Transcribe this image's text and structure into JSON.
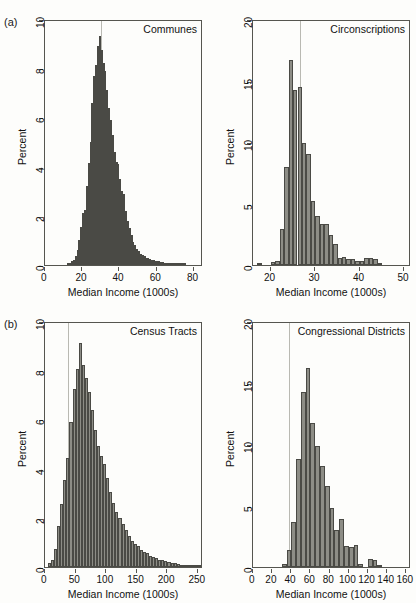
{
  "figure": {
    "panel_tags": [
      "(a)",
      "(b)"
    ],
    "xlabel": "Median Income (1000s)",
    "ylabel": "Percent",
    "bar_color": "#8d8d86",
    "bar_border_color": "#4a4a45",
    "refline_color": "#b9b9b2",
    "axis_color": "#55554f",
    "background": "#fdfdfb"
  },
  "chart_data": [
    {
      "type": "bar",
      "panel": "(a)",
      "title": "Communes",
      "xlabel": "Median Income (1000s)",
      "ylabel": "Percent",
      "xlim": [
        0,
        85
      ],
      "ylim": [
        0,
        10
      ],
      "xticks": [
        0,
        20,
        40,
        60,
        80
      ],
      "yticks": [
        0,
        2,
        4,
        6,
        8,
        10
      ],
      "grid": false,
      "reference_line_x": 30,
      "bin_width": 1,
      "bin_starts": [
        12,
        13,
        14,
        15,
        16,
        17,
        18,
        19,
        20,
        21,
        22,
        23,
        24,
        25,
        26,
        27,
        28,
        29,
        30,
        31,
        32,
        33,
        34,
        35,
        36,
        37,
        38,
        39,
        40,
        41,
        42,
        43,
        44,
        45,
        46,
        47,
        48,
        49,
        50,
        51,
        52,
        53,
        54,
        55,
        56,
        57,
        58,
        59,
        60,
        61,
        62,
        63,
        64,
        65,
        66,
        67,
        68,
        69,
        70,
        71,
        72,
        73,
        74,
        75
      ],
      "values": [
        0.05,
        0.1,
        0.15,
        0.2,
        0.35,
        0.6,
        1.0,
        1.55,
        2.1,
        2.25,
        3.2,
        4.15,
        5.0,
        6.6,
        7.7,
        8.15,
        8.9,
        9.3,
        8.75,
        8.2,
        7.9,
        7.1,
        6.4,
        5.9,
        5.3,
        4.6,
        4.2,
        4.1,
        3.5,
        3.0,
        2.9,
        2.2,
        1.8,
        1.5,
        1.2,
        0.95,
        0.8,
        0.65,
        0.55,
        0.45,
        0.4,
        0.35,
        0.3,
        0.28,
        0.25,
        0.22,
        0.2,
        0.18,
        0.16,
        0.15,
        0.13,
        0.12,
        0.1,
        0.09,
        0.08,
        0.07,
        0.06,
        0.05,
        0.05,
        0.04,
        0.04,
        0.03,
        0.03,
        0.02
      ]
    },
    {
      "type": "bar",
      "panel": "(a)",
      "title": "Circonscriptions",
      "xlabel": "Median Income (1000s)",
      "ylabel": "Percent",
      "xlim": [
        16,
        51.5
      ],
      "ylim": [
        0,
        20
      ],
      "xticks": [
        20,
        30,
        40,
        50
      ],
      "yticks": [
        0,
        5,
        10,
        15,
        20
      ],
      "grid": false,
      "reference_line_x": 26.5,
      "bin_width": 1,
      "bin_starts": [
        17,
        18,
        19,
        20,
        21,
        22,
        23,
        24,
        25,
        26,
        27,
        28,
        29,
        30,
        31,
        32,
        33,
        34,
        35,
        36,
        37,
        38,
        39,
        40,
        41,
        42,
        43,
        44,
        45,
        46,
        47,
        48,
        49,
        50,
        51
      ],
      "values": [
        0.15,
        0.0,
        0.0,
        0.25,
        0.3,
        2.9,
        8.0,
        16.7,
        14.2,
        14.5,
        9.9,
        9.0,
        5.2,
        4.0,
        3.3,
        3.3,
        2.4,
        1.7,
        0.6,
        0.65,
        0.45,
        0.5,
        0.35,
        0.3,
        0.6,
        0.6,
        0.5,
        0.15,
        0.0,
        0.0,
        0.0,
        0.0,
        0.0,
        0.0,
        0.0
      ]
    },
    {
      "type": "bar",
      "panel": "(b)",
      "title": "Census Tracts",
      "xlabel": "Median Income (1000s)",
      "ylabel": "Percent",
      "xlim": [
        0,
        258
      ],
      "ylim": [
        0,
        10
      ],
      "xticks": [
        0,
        50,
        100,
        150,
        200,
        250
      ],
      "yticks": [
        0,
        2,
        4,
        6,
        8,
        10
      ],
      "grid": false,
      "reference_line_x": 37,
      "bin_width": 5,
      "bin_starts": [
        5,
        10,
        15,
        20,
        25,
        30,
        35,
        40,
        45,
        50,
        55,
        60,
        65,
        70,
        75,
        80,
        85,
        90,
        95,
        100,
        105,
        110,
        115,
        120,
        125,
        130,
        135,
        140,
        145,
        150,
        155,
        160,
        165,
        170,
        175,
        180,
        185,
        190,
        195,
        200,
        205,
        210,
        215,
        220,
        225,
        230,
        235,
        240,
        245,
        250
      ],
      "values": [
        0.15,
        0.3,
        0.75,
        1.65,
        2.55,
        3.55,
        4.45,
        5.9,
        7.25,
        8.05,
        9.1,
        8.2,
        7.7,
        7.1,
        6.4,
        5.55,
        4.9,
        4.5,
        4.2,
        3.6,
        3.05,
        2.6,
        2.25,
        2.0,
        1.75,
        1.5,
        1.25,
        1.05,
        0.95,
        0.85,
        0.7,
        0.6,
        0.55,
        0.45,
        0.4,
        0.35,
        0.3,
        0.28,
        0.25,
        0.2,
        0.18,
        0.15,
        0.12,
        0.1,
        0.08,
        0.07,
        0.05,
        0.04,
        0.03,
        0.02
      ]
    },
    {
      "type": "bar",
      "panel": "(b)",
      "title": "Congressional Districts",
      "xlabel": "Median Income (1000s)",
      "ylabel": "Percent",
      "xlim": [
        0,
        165
      ],
      "ylim": [
        0,
        20
      ],
      "xticks": [
        0,
        20,
        40,
        60,
        80,
        100,
        120,
        140,
        160
      ],
      "yticks": [
        0,
        5,
        10,
        15,
        20
      ],
      "grid": false,
      "reference_line_x": 38,
      "bin_width": 5,
      "bin_starts": [
        30,
        35,
        40,
        45,
        50,
        55,
        60,
        65,
        70,
        75,
        80,
        85,
        90,
        95,
        100,
        105,
        110,
        115,
        120,
        125,
        130
      ],
      "values": [
        0.25,
        1.35,
        3.7,
        8.75,
        14.2,
        16.2,
        11.7,
        9.8,
        8.2,
        6.6,
        4.8,
        3.0,
        3.9,
        1.7,
        1.65,
        1.75,
        0.25,
        0.0,
        0.65,
        0.6,
        0.1
      ]
    }
  ]
}
